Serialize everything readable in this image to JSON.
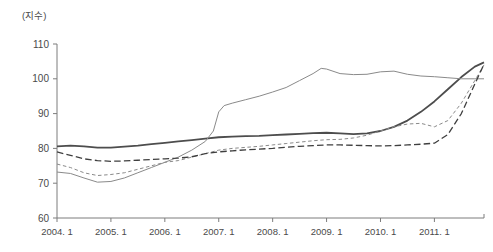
{
  "chart": {
    "unit_label": "(지수)",
    "title": ""
  },
  "chart_data": {
    "type": "line",
    "title": "",
    "xlabel": "",
    "ylabel": "(지수)",
    "ylim": [
      60,
      110
    ],
    "xlim": [
      2004.0,
      2011.92
    ],
    "yticks": [
      60,
      70,
      80,
      90,
      100,
      110
    ],
    "xticks": [
      2004.0,
      2005.0,
      2006.0,
      2007.0,
      2008.0,
      2009.0,
      2010.0,
      2011.0
    ],
    "xtick_labels": [
      "2004. 1",
      "2005. 1",
      "2006. 1",
      "2007. 1",
      "2008. 1",
      "2009. 1",
      "2010. 1",
      "2011. 1"
    ],
    "grid": false,
    "legend": "none",
    "series": [
      {
        "name": "series-thick-solid",
        "style": "solid",
        "width": 1.8,
        "color": "#4d4d4d",
        "x": [
          2004.0,
          2004.25,
          2004.5,
          2004.75,
          2005.0,
          2005.25,
          2005.5,
          2005.75,
          2006.0,
          2006.25,
          2006.5,
          2006.75,
          2007.0,
          2007.25,
          2007.5,
          2007.75,
          2008.0,
          2008.25,
          2008.5,
          2008.75,
          2009.0,
          2009.25,
          2009.5,
          2009.75,
          2010.0,
          2010.25,
          2010.5,
          2010.75,
          2011.0,
          2011.25,
          2011.5,
          2011.75,
          2011.92
        ],
        "values": [
          80.6,
          80.8,
          80.6,
          80.2,
          80.2,
          80.5,
          80.8,
          81.2,
          81.6,
          82.0,
          82.4,
          82.8,
          83.2,
          83.4,
          83.5,
          83.6,
          83.8,
          84.0,
          84.2,
          84.4,
          84.5,
          84.3,
          84.1,
          84.3,
          85.0,
          86.2,
          88.0,
          90.5,
          93.5,
          97.0,
          100.5,
          103.5,
          104.7
        ]
      },
      {
        "name": "series-thin-solid",
        "style": "solid",
        "width": 1.0,
        "color": "#8a8a8a",
        "x": [
          2004.0,
          2004.25,
          2004.5,
          2004.75,
          2005.0,
          2005.25,
          2005.5,
          2005.75,
          2006.0,
          2006.25,
          2006.5,
          2006.75,
          2006.9,
          2007.0,
          2007.1,
          2007.25,
          2007.5,
          2007.75,
          2008.0,
          2008.25,
          2008.5,
          2008.75,
          2008.9,
          2009.0,
          2009.25,
          2009.5,
          2009.75,
          2010.0,
          2010.25,
          2010.5,
          2010.75,
          2011.0,
          2011.25,
          2011.5,
          2011.75,
          2011.92
        ],
        "values": [
          73.2,
          72.8,
          71.5,
          70.3,
          70.5,
          71.5,
          73.0,
          74.5,
          76.0,
          77.5,
          79.5,
          82.0,
          85.0,
          90.5,
          92.3,
          93.0,
          94.0,
          95.0,
          96.2,
          97.5,
          99.5,
          101.5,
          103.0,
          102.8,
          101.5,
          101.2,
          101.3,
          102.0,
          102.2,
          101.3,
          100.8,
          100.6,
          100.3,
          100.0,
          100.0,
          100.0
        ]
      },
      {
        "name": "series-short-dash",
        "style": "short-dash",
        "width": 1.0,
        "color": "#8a8a8a",
        "x": [
          2004.0,
          2004.25,
          2004.5,
          2004.75,
          2005.0,
          2005.25,
          2005.5,
          2005.75,
          2006.0,
          2006.25,
          2006.5,
          2006.75,
          2007.0,
          2007.25,
          2007.5,
          2007.75,
          2008.0,
          2008.25,
          2008.5,
          2008.75,
          2009.0,
          2009.25,
          2009.5,
          2009.75,
          2010.0,
          2010.25,
          2010.5,
          2010.75,
          2011.0,
          2011.25,
          2011.5,
          2011.75,
          2011.92
        ],
        "values": [
          75.5,
          74.5,
          73.0,
          72.2,
          72.5,
          73.0,
          74.0,
          75.0,
          76.0,
          76.5,
          77.5,
          78.5,
          79.5,
          80.0,
          80.3,
          80.6,
          81.0,
          81.4,
          81.8,
          82.2,
          82.5,
          82.6,
          83.0,
          83.8,
          85.0,
          86.2,
          87.0,
          87.2,
          86.2,
          88.0,
          93.0,
          99.5,
          104.0
        ]
      },
      {
        "name": "series-long-dash",
        "style": "long-dash",
        "width": 1.3,
        "color": "#3f3f3f",
        "x": [
          2004.0,
          2004.25,
          2004.5,
          2004.75,
          2005.0,
          2005.25,
          2005.5,
          2005.75,
          2006.0,
          2006.25,
          2006.5,
          2006.75,
          2007.0,
          2007.25,
          2007.5,
          2007.75,
          2008.0,
          2008.25,
          2008.5,
          2008.75,
          2009.0,
          2009.25,
          2009.5,
          2009.75,
          2010.0,
          2010.25,
          2010.5,
          2010.75,
          2011.0,
          2011.25,
          2011.5,
          2011.75,
          2011.92
        ],
        "values": [
          79.0,
          78.0,
          77.0,
          76.5,
          76.3,
          76.4,
          76.6,
          76.8,
          77.0,
          77.2,
          77.6,
          78.5,
          79.0,
          79.3,
          79.6,
          79.8,
          80.0,
          80.3,
          80.6,
          80.8,
          81.0,
          81.0,
          80.9,
          80.8,
          80.7,
          80.8,
          81.0,
          81.2,
          81.5,
          84.0,
          90.0,
          98.5,
          104.2
        ]
      }
    ]
  }
}
